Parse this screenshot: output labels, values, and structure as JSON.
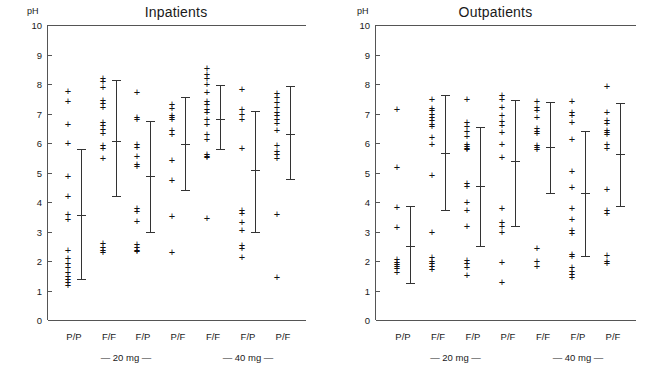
{
  "figure": {
    "y_axis_label": "pH",
    "y_ticks": [
      0,
      1,
      2,
      3,
      4,
      5,
      6,
      7,
      8,
      9,
      10
    ],
    "ylim": [
      0,
      10
    ],
    "categories": [
      "P/P",
      "F/F",
      "F/P",
      "P/F",
      "F/F",
      "F/P",
      "P/F"
    ],
    "group_labels": [
      "— 20 mg —",
      "— 40 mg —"
    ],
    "marker": "plus-marker",
    "ink_color": "#111111",
    "axis_color": "#555555"
  },
  "chart_data": [
    {
      "type": "scatter",
      "title": "Inpatients",
      "xlabel": "",
      "ylabel": "pH",
      "ylim": [
        0,
        10
      ],
      "grid": false,
      "legend": "none",
      "categories": [
        "P/P",
        "F/F",
        "F/P",
        "P/F",
        "F/F",
        "F/P",
        "P/F"
      ],
      "group_labels": [
        "— 20 mg —",
        "— 40 mg —"
      ],
      "group_spans": [
        [
          0,
          3
        ],
        [
          4,
          6
        ]
      ],
      "series": [
        {
          "name": "P/P 20 mg",
          "points": [
            7.75,
            7.42,
            6.62,
            5.97,
            4.87,
            4.2,
            3.57,
            3.4,
            2.35,
            2.1,
            1.9,
            1.78,
            1.62,
            1.48,
            1.38,
            1.28,
            1.18
          ],
          "mean": 3.57,
          "range": [
            1.4,
            5.8
          ]
        },
        {
          "name": "F/F 20 mg",
          "points": [
            8.18,
            8.08,
            7.88,
            7.45,
            7.35,
            7.22,
            6.68,
            6.58,
            6.45,
            6.32,
            5.92,
            5.8,
            5.47,
            2.58,
            2.45,
            2.35,
            2.28
          ],
          "mean": 6.07,
          "range": [
            4.2,
            8.12
          ]
        },
        {
          "name": "F/P 20 mg",
          "points": [
            7.72,
            6.85,
            6.78,
            5.95,
            5.85,
            5.55,
            5.28,
            5.2,
            3.78,
            3.68,
            3.35,
            2.55,
            2.45,
            2.35,
            2.32
          ],
          "mean": 4.88,
          "range": [
            2.97,
            6.75
          ]
        },
        {
          "name": "P/F 20 mg",
          "points": [
            7.3,
            7.18,
            6.92,
            6.85,
            6.78,
            6.42,
            6.3,
            5.42,
            4.72,
            3.5,
            2.3
          ],
          "mean": 5.97,
          "range": [
            4.4,
            7.55
          ]
        },
        {
          "name": "F/F 40 mg",
          "points": [
            8.52,
            8.32,
            8.2,
            7.98,
            7.72,
            7.42,
            7.32,
            7.15,
            7.02,
            6.78,
            6.62,
            6.3,
            6.12,
            5.62,
            5.55,
            5.52,
            3.45
          ],
          "mean": 6.8,
          "range": [
            5.78,
            7.95
          ]
        },
        {
          "name": "F/P 40 mg",
          "points": [
            7.8,
            7.12,
            6.98,
            6.78,
            5.8,
            3.7,
            3.62,
            3.32,
            3.05,
            2.52,
            2.42,
            2.12
          ],
          "mean": 5.07,
          "range": [
            2.97,
            7.1
          ]
        },
        {
          "name": "P/F 40 mg",
          "points": [
            7.68,
            7.55,
            7.38,
            7.22,
            7.05,
            6.92,
            6.78,
            6.65,
            6.42,
            5.92,
            5.72,
            5.6,
            5.48,
            3.58,
            1.45
          ],
          "mean": 6.32,
          "range": [
            4.78,
            7.92
          ]
        }
      ]
    },
    {
      "type": "scatter",
      "title": "Outpatients",
      "xlabel": "",
      "ylabel": "pH",
      "ylim": [
        0,
        10
      ],
      "grid": false,
      "legend": "none",
      "categories": [
        "P/P",
        "F/F",
        "F/P",
        "P/F",
        "F/F",
        "F/P",
        "P/F"
      ],
      "group_labels": [
        "— 20 mg —",
        "— 40 mg —"
      ],
      "group_spans": [
        [
          0,
          3
        ],
        [
          4,
          6
        ]
      ],
      "series": [
        {
          "name": "P/P 20 mg",
          "points": [
            7.12,
            5.18,
            3.8,
            3.15,
            2.05,
            1.95,
            1.88,
            1.82,
            1.75,
            1.62
          ],
          "mean": 2.52,
          "range": [
            1.25,
            3.88
          ]
        },
        {
          "name": "F/F 20 mg",
          "points": [
            7.48,
            7.18,
            7.1,
            6.98,
            6.88,
            6.75,
            6.62,
            6.55,
            6.2,
            5.95,
            4.9,
            2.95,
            2.12,
            2.0,
            1.9,
            1.8,
            1.7
          ],
          "mean": 5.65,
          "range": [
            3.72,
            7.62
          ]
        },
        {
          "name": "F/P 20 mg",
          "points": [
            7.48,
            6.68,
            6.55,
            6.4,
            6.22,
            5.95,
            5.88,
            5.82,
            5.78,
            4.62,
            4.52,
            4.0,
            3.72,
            3.18,
            2.02,
            1.92,
            1.78,
            1.5
          ],
          "mean": 4.55,
          "range": [
            2.52,
            6.55
          ]
        },
        {
          "name": "P/F 20 mg",
          "points": [
            7.6,
            7.48,
            7.2,
            6.92,
            6.72,
            6.58,
            6.35,
            5.95,
            5.5,
            3.78,
            3.3,
            3.18,
            2.98,
            1.95,
            1.28
          ],
          "mean": 5.4,
          "range": [
            3.2,
            7.45
          ]
        },
        {
          "name": "F/F 40 mg",
          "points": [
            7.42,
            7.22,
            7.1,
            6.88,
            6.48,
            6.4,
            6.32,
            5.9,
            5.85,
            5.78,
            2.42,
            1.98,
            1.82
          ],
          "mean": 5.88,
          "range": [
            4.32,
            7.38
          ]
        },
        {
          "name": "F/P 40 mg",
          "points": [
            7.4,
            7.02,
            6.92,
            6.7,
            6.12,
            5.02,
            4.48,
            3.78,
            3.42,
            3.05,
            2.92,
            2.22,
            2.15,
            1.78,
            1.65,
            1.55,
            1.45
          ],
          "mean": 4.32,
          "range": [
            2.18,
            6.42
          ]
        },
        {
          "name": "P/F 40 mg",
          "points": [
            7.92,
            7.05,
            6.75,
            6.65,
            6.42,
            6.35,
            6.28,
            5.95,
            5.82,
            4.42,
            3.72,
            3.62,
            2.18,
            2.0,
            1.92
          ],
          "mean": 5.62,
          "range": [
            3.88,
            7.35
          ]
        }
      ]
    }
  ]
}
